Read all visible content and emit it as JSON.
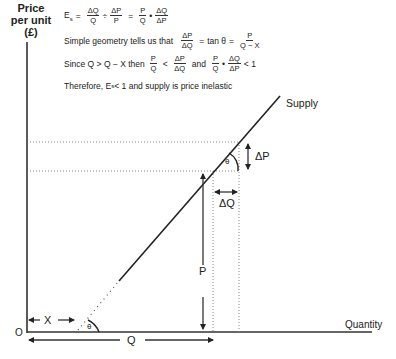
{
  "y_axis_label": [
    "Price",
    "per unit",
    "(£)"
  ],
  "x_axis_label": "Quantity",
  "origin_label": "O",
  "curve_label": "Supply",
  "labels": {
    "delta_p": "ΔP",
    "delta_q": "ΔQ",
    "p": "P",
    "q": "Q",
    "x": "X",
    "theta": "θ"
  },
  "formulas": {
    "line1": {
      "lhs": "E",
      "lhs_sub": "s",
      "eq": "=",
      "f1_num": "ΔQ",
      "f1_den": "Q",
      "div": "÷",
      "f2_num": "ΔP",
      "f2_den": "P",
      "eq2": "=",
      "f3_num": "P",
      "f3_den": "Q",
      "dot": "•",
      "f4_num": "ΔQ",
      "f4_den": "ΔP"
    },
    "line2": {
      "text": "Simple geometry tells us that",
      "f1_num": "ΔP",
      "f1_den": "ΔQ",
      "eq": "=",
      "mid": "tan θ",
      "eq2": "=",
      "f2_num": "P",
      "f2_den": "Q − X"
    },
    "line3": {
      "text": "Since Q > Q − X  then",
      "f1_num": "P",
      "f1_den": "Q",
      "lt": "<",
      "f2_num": "ΔP",
      "f2_den": "ΔQ",
      "and": "and",
      "f3_num": "P",
      "f3_den": "Q",
      "dot": "•",
      "f4_num": "ΔQ",
      "f4_den": "ΔP",
      "tail": "< 1"
    },
    "line4": {
      "pre": "Therefore,  E",
      "sub": "s",
      "post": " < 1 and supply is price inelastic"
    }
  }
}
